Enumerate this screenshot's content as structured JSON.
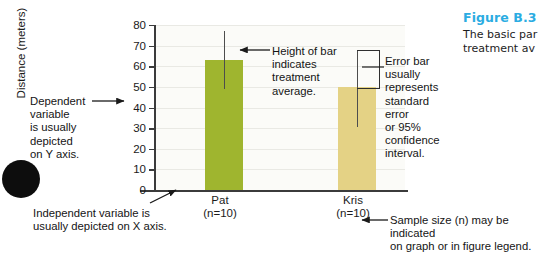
{
  "chart_data": {
    "type": "bar",
    "title": "",
    "xlabel": "",
    "ylabel": "Distance (meters)",
    "categories": [
      "Pat",
      "Kris"
    ],
    "category_sublabels": [
      "(n=10)",
      "(n=10)"
    ],
    "values": [
      63,
      50
    ],
    "error_bars": [
      {
        "upper": 77,
        "lower": 49
      },
      {
        "upper": 68,
        "lower": 50
      }
    ],
    "ylim": [
      0,
      80
    ],
    "yticks": [
      0,
      10,
      20,
      30,
      40,
      50,
      60,
      70,
      80
    ],
    "ytick_labels": [
      "0",
      "10",
      "20",
      "30",
      "40",
      "50",
      "60",
      "70",
      "80"
    ],
    "grid": true,
    "legend": "none",
    "colors": {
      "bar_pat": "#9FB52F",
      "bar_kris": "#E4D285",
      "axis": "#3b3b3b",
      "gridline": "#e9e9e4",
      "plot_bg": "#fbfbf8",
      "caption_accent": "#2BACE2"
    }
  },
  "annotations": {
    "dependent_variable": "Dependent\nvariable\nis usually\ndepicted\non Y axis.",
    "dependent_variable_lines": [
      "Dependent",
      "variable",
      "is usually",
      "depicted",
      "on Y axis."
    ],
    "height_of_bar_lines": [
      "Height of bar",
      "indicates",
      "treatment",
      "average."
    ],
    "error_bar_lines": [
      "Error bar",
      "usually",
      "represents",
      "standard error",
      "or 95%",
      "confidence",
      "interval."
    ],
    "independent_variable_lines": [
      "Independent variable is",
      "usually depicted on X axis."
    ],
    "sample_size_lines": [
      "Sample size (n) may be indicated",
      "on graph or in figure legend."
    ]
  },
  "caption": {
    "figure_number": "Figure B.3",
    "body_lines": [
      "The basic par",
      "treatment av"
    ]
  }
}
